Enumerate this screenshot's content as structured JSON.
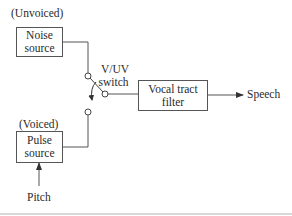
{
  "diagram": {
    "type": "block-diagram",
    "title": "",
    "nodes": [
      {
        "id": "noise",
        "label_line1": "Noise",
        "label_line2": "source",
        "annotation": "(Unvoiced)"
      },
      {
        "id": "pulse",
        "label_line1": "Pulse",
        "label_line2": "source",
        "annotation": "(Voiced)"
      },
      {
        "id": "switch",
        "label_line1": "V/UV",
        "label_line2": "switch"
      },
      {
        "id": "filter",
        "label_line1": "Vocal tract",
        "label_line2": "filter"
      }
    ],
    "inputs": {
      "pitch": "Pitch"
    },
    "outputs": {
      "speech": "Speech"
    },
    "edges": [
      {
        "from": "noise",
        "to": "switch"
      },
      {
        "from": "pulse",
        "to": "switch"
      },
      {
        "from": "pitch",
        "to": "pulse"
      },
      {
        "from": "switch",
        "to": "filter"
      },
      {
        "from": "filter",
        "to": "speech"
      }
    ]
  },
  "colors": {
    "line": "#555555",
    "text": "#2a2a2a",
    "divider": "#d9d9d9"
  }
}
